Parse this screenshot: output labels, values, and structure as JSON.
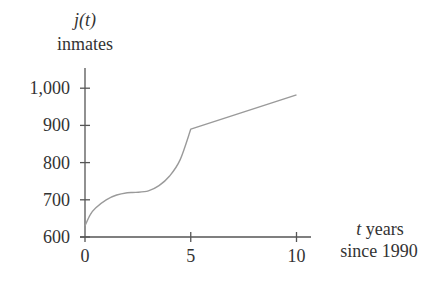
{
  "chart_data": {
    "type": "line",
    "title": "",
    "ylabel_function": "j(t)",
    "ylabel_unit": "inmates",
    "xlabel_var": "t",
    "xlabel_unit": "years",
    "xlabel_line2": "since 1990",
    "xlim": [
      0,
      10
    ],
    "ylim": [
      600,
      1000
    ],
    "x_ticks": [
      0,
      5,
      10
    ],
    "x_tick_labels": [
      "0",
      "5",
      "10"
    ],
    "y_ticks": [
      600,
      700,
      800,
      900,
      1000
    ],
    "y_tick_labels": [
      "600",
      "700",
      "800",
      "900",
      "1,000"
    ],
    "grid": false,
    "legend": null,
    "series": [
      {
        "name": "j(t)",
        "x": [
          0,
          0.25,
          0.5,
          1,
          1.5,
          2,
          2.4,
          3,
          3.5,
          4,
          4.5,
          5,
          10
        ],
        "values": [
          630,
          660,
          678,
          700,
          713,
          719,
          720,
          724,
          738,
          764,
          808,
          890,
          982
        ]
      }
    ],
    "annotations": [
      "curve increases concavely to a near-flat region around t≈2.4, then convexly up to t=5, followed by a straight line to t=10"
    ]
  },
  "colors": {
    "axis": "#555555",
    "curve": "#9a9a9a",
    "text": "#333333"
  }
}
